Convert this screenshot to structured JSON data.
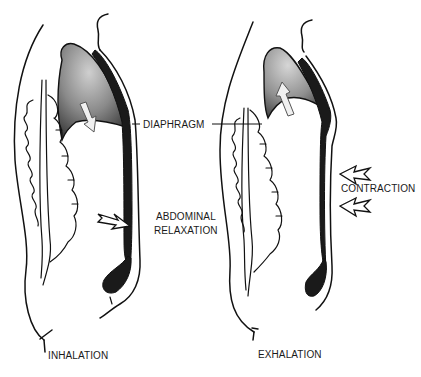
{
  "labels": {
    "diaphragm": "DIAPHRAGM",
    "abdominal_relaxation_line1": "ABDOMINAL",
    "abdominal_relaxation_line2": "RELAXATION",
    "contraction": "CONTRACTION",
    "inhalation": "INHALATION",
    "exhalation": "EXHALATION"
  },
  "panels": [
    {
      "id": "inhalation",
      "diaphragm_arrow": "down",
      "abdomen_arrow": "outward-right"
    },
    {
      "id": "exhalation",
      "diaphragm_arrow": "up",
      "abdomen_arrows": [
        "inward-left",
        "inward-left"
      ]
    }
  ],
  "colors": {
    "outline": "#111111",
    "lung_shade_dark": "#3a3a3a",
    "lung_shade_light": "#bdbdbd",
    "muscle": "#1a1a1a",
    "background": "#ffffff"
  }
}
